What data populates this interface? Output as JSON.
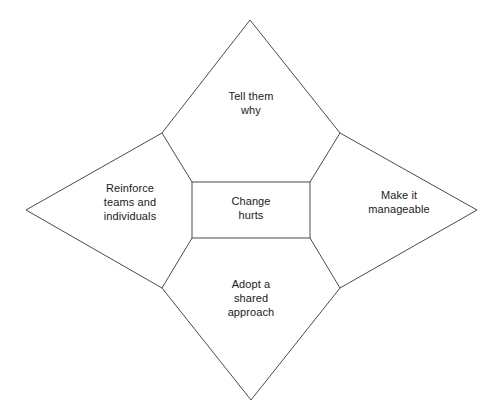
{
  "diagram": {
    "type": "star-concept-diagram",
    "canvas": {
      "width": 499,
      "height": 416,
      "background": "#ffffff"
    },
    "style": {
      "stroke_color": "#4a4a4a",
      "stroke_width": 1,
      "fill_color": "#ffffff",
      "text_color": "#1a1a1a"
    },
    "center": {
      "label": "Change\nhurts",
      "shape": "rectangle",
      "rect": {
        "x": 192,
        "y": 182,
        "width": 118,
        "height": 56
      }
    },
    "points": [
      {
        "id": "top",
        "label": "Tell them\nwhy",
        "apex": {
          "x": 250,
          "y": 20
        },
        "notch_left": {
          "x": 162,
          "y": 133
        },
        "notch_right": {
          "x": 340,
          "y": 133
        }
      },
      {
        "id": "left",
        "label": "Reinforce\nteams and\nindividuals",
        "apex": {
          "x": 26,
          "y": 210
        },
        "notch_left": {
          "x": 162,
          "y": 288
        },
        "notch_right": {
          "x": 162,
          "y": 133
        }
      },
      {
        "id": "right",
        "label": "Make it\nmanageable",
        "apex": {
          "x": 477,
          "y": 210
        },
        "notch_left": {
          "x": 340,
          "y": 133
        },
        "notch_right": {
          "x": 340,
          "y": 288
        }
      },
      {
        "id": "bottom",
        "label": "Adopt a\nshared\napproach",
        "apex": {
          "x": 251,
          "y": 400
        },
        "notch_left": {
          "x": 340,
          "y": 288
        },
        "notch_right": {
          "x": 162,
          "y": 288
        }
      }
    ],
    "outline_path": "M 250 20 L 340 133 L 477 210 L 340 288 L 251 400 L 162 288 L 26 210 L 162 133 Z",
    "spokes": [
      {
        "from": {
          "x": 162,
          "y": 133
        },
        "to": {
          "x": 192,
          "y": 182
        }
      },
      {
        "from": {
          "x": 340,
          "y": 133
        },
        "to": {
          "x": 310,
          "y": 182
        }
      },
      {
        "from": {
          "x": 340,
          "y": 288
        },
        "to": {
          "x": 310,
          "y": 238
        }
      },
      {
        "from": {
          "x": 162,
          "y": 288
        },
        "to": {
          "x": 192,
          "y": 238
        }
      }
    ]
  }
}
